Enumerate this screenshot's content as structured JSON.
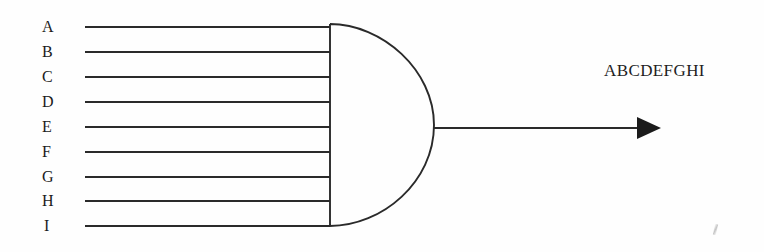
{
  "diagram": {
    "type": "logic-gate-diagram",
    "gate": {
      "kind": "AND",
      "name": "and-gate",
      "input_count": 9,
      "body": {
        "left_edge_x": 330,
        "top_y": 24,
        "bottom_y": 226,
        "apex_x": 434,
        "apex_y": 128
      }
    },
    "inputs": [
      {
        "label": "A",
        "label_x": 42,
        "y": 27,
        "line_start_x": 85,
        "line_end_x": 330
      },
      {
        "label": "B",
        "label_x": 42,
        "y": 52,
        "line_start_x": 85,
        "line_end_x": 330
      },
      {
        "label": "C",
        "label_x": 42,
        "y": 77,
        "line_start_x": 85,
        "line_end_x": 330
      },
      {
        "label": "D",
        "label_x": 42,
        "y": 102,
        "line_start_x": 85,
        "line_end_x": 330
      },
      {
        "label": "E",
        "label_x": 42,
        "y": 127,
        "line_start_x": 85,
        "line_end_x": 330
      },
      {
        "label": "F",
        "label_x": 42,
        "y": 152,
        "line_start_x": 85,
        "line_end_x": 330
      },
      {
        "label": "G",
        "label_x": 42,
        "y": 177,
        "line_start_x": 85,
        "line_end_x": 330
      },
      {
        "label": "H",
        "label_x": 42,
        "y": 201,
        "line_start_x": 85,
        "line_end_x": 330
      },
      {
        "label": "I",
        "label_x": 42,
        "y": 226,
        "line_start_x": 85,
        "line_end_x": 330
      }
    ],
    "output": {
      "label": "ABCDEFGHI",
      "label_x": 604,
      "label_y": 61,
      "line_start_x": 434,
      "line_end_x": 661,
      "line_y": 128,
      "arrowhead": "filled-triangle"
    },
    "colors": {
      "ink": "#1b1b1b",
      "line": "#2a2a2a",
      "background": "#fefefe"
    }
  }
}
